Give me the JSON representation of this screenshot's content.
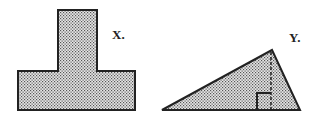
{
  "figures": [
    {
      "id": "X",
      "label": "X.",
      "shape": "T-shape (composite rectangles)",
      "fill": "stippled gray"
    },
    {
      "id": "Y",
      "label": "Y.",
      "shape": "triangle with dashed altitude and right-angle marker",
      "fill": "stippled gray"
    }
  ],
  "colors": {
    "stroke": "#222222",
    "fill_dots": "#555555",
    "background": "#ffffff"
  }
}
